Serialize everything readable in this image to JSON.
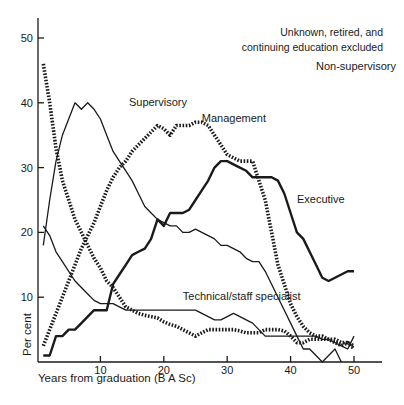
{
  "chart_data": {
    "type": "line",
    "title": "",
    "annotation": [
      "Unknown, retired, and",
      "continuing education excluded"
    ],
    "xlabel": "Years from graduation (B A Sc)",
    "ylabel": "Per cent",
    "xlim": [
      0,
      54
    ],
    "ylim": [
      0,
      53
    ],
    "xticks": [
      10,
      20,
      30,
      40,
      50
    ],
    "yticks": [
      10,
      20,
      30,
      40,
      50
    ],
    "grid": false,
    "legend": "inline labels",
    "series": [
      {
        "name": "Non-supervisory",
        "style": "dotted-thick",
        "label_pos": [
          44,
          45
        ],
        "x": [
          1,
          2,
          3,
          4,
          5,
          6,
          7,
          8,
          9,
          10,
          11,
          12,
          13,
          14,
          15,
          16,
          17,
          18,
          19,
          20,
          21,
          22,
          23,
          24,
          25,
          26,
          27,
          28,
          29,
          30,
          31,
          32,
          33,
          34,
          35,
          36,
          37,
          38,
          39,
          40,
          41,
          42,
          43,
          44,
          45,
          46,
          47,
          48,
          49,
          50
        ],
        "values": [
          46,
          40,
          33,
          28,
          25,
          22,
          20,
          18,
          16,
          14.5,
          12.5,
          11.5,
          10,
          8.5,
          8,
          7.5,
          7.2,
          7,
          6.8,
          6.2,
          5.8,
          5.5,
          5,
          4.5,
          4,
          4.5,
          5,
          5,
          5,
          5,
          5,
          4.8,
          4.5,
          4.5,
          4.5,
          5,
          5,
          5,
          4.8,
          4,
          3,
          3,
          3.5,
          3.5,
          3.5,
          3.5,
          3,
          2.5,
          3,
          2
        ]
      },
      {
        "name": "Supervisory",
        "style": "solid-thin",
        "label_pos": [
          14.5,
          39.5
        ],
        "x": [
          1,
          2,
          3,
          4,
          5,
          6,
          7,
          8,
          9,
          10,
          11,
          12,
          13,
          14,
          15,
          16,
          17,
          18,
          19,
          20,
          21,
          22,
          23,
          24,
          25,
          26,
          27,
          28,
          29,
          30,
          31,
          32,
          33,
          34,
          35,
          36,
          37,
          38,
          39,
          40,
          41,
          42,
          43,
          44,
          45,
          46,
          47,
          48
        ],
        "values": [
          18,
          25,
          31,
          35,
          37.5,
          40,
          39,
          40,
          39,
          37.5,
          35,
          32.5,
          31,
          29.5,
          28,
          26,
          24,
          23,
          22,
          21.5,
          21,
          21,
          20,
          20,
          20.5,
          20,
          19.5,
          19,
          18,
          18,
          17.5,
          17,
          16,
          15.5,
          15.5,
          14,
          12,
          10,
          8,
          6,
          4,
          2,
          2,
          1,
          0,
          1,
          2,
          0
        ]
      },
      {
        "name": "Management",
        "style": "dotted-thick",
        "label_pos": [
          26,
          37
        ],
        "x": [
          1,
          2,
          3,
          4,
          5,
          6,
          7,
          8,
          9,
          10,
          11,
          12,
          13,
          14,
          15,
          16,
          17,
          18,
          19,
          20,
          21,
          22,
          23,
          24,
          25,
          26,
          27,
          28,
          29,
          30,
          31,
          32,
          33,
          34,
          35,
          36,
          37,
          38,
          39,
          40,
          41,
          42,
          43,
          44,
          45,
          46,
          47,
          48,
          49,
          50
        ],
        "values": [
          2.5,
          5,
          7.5,
          10,
          12.5,
          15,
          17.5,
          19.5,
          21.5,
          24,
          26.5,
          28.5,
          30,
          31,
          32.5,
          33.5,
          34.5,
          35.5,
          36.5,
          36,
          35,
          36.5,
          36.5,
          36.5,
          37,
          37,
          36.5,
          35,
          33.5,
          32,
          31.5,
          31,
          31,
          31,
          28,
          25,
          20,
          15,
          12,
          9,
          7,
          5.5,
          4.5,
          4,
          4,
          3.5,
          3.5,
          3,
          3,
          2.5
        ]
      },
      {
        "name": "Executive",
        "style": "solid-thick",
        "label_pos": [
          41,
          24.5
        ],
        "x": [
          1,
          2,
          3,
          4,
          5,
          6,
          7,
          8,
          9,
          10,
          11,
          12,
          13,
          14,
          15,
          16,
          17,
          18,
          19,
          20,
          21,
          22,
          23,
          24,
          25,
          26,
          27,
          28,
          29,
          30,
          31,
          32,
          33,
          34,
          35,
          36,
          37,
          38,
          39,
          40,
          41,
          42,
          43,
          44,
          45,
          46,
          47,
          48,
          49,
          50
        ],
        "values": [
          1,
          1,
          4,
          4,
          5,
          5,
          6,
          7,
          8,
          8,
          8,
          12,
          13.5,
          15,
          16.5,
          17,
          17.5,
          19,
          22,
          21,
          23,
          23,
          23,
          23.5,
          25,
          26.5,
          28,
          30,
          31,
          31,
          30.5,
          30,
          29.5,
          28.5,
          28.5,
          28.5,
          28.5,
          28,
          26,
          23,
          20,
          19,
          17,
          15,
          13,
          12.5,
          13,
          13.5,
          14,
          14
        ]
      },
      {
        "name": "Technical/staff specialist",
        "style": "solid-thin",
        "label_pos": [
          23,
          9.5
        ],
        "x": [
          1,
          2,
          3,
          4,
          5,
          6,
          7,
          8,
          9,
          10,
          11,
          12,
          13,
          14,
          15,
          16,
          17,
          18,
          19,
          20,
          21,
          22,
          23,
          24,
          25,
          26,
          27,
          28,
          29,
          30,
          31,
          32,
          33,
          34,
          35,
          36,
          37,
          38,
          39,
          40,
          41,
          42,
          43,
          44,
          45,
          46,
          47,
          48,
          49,
          50
        ],
        "values": [
          21,
          19.5,
          17,
          15.5,
          14,
          12.5,
          11.5,
          10.5,
          9.5,
          9,
          9,
          9,
          8.5,
          8,
          8,
          8,
          8,
          8,
          8,
          8,
          8,
          8,
          8,
          8,
          8,
          7.5,
          7,
          6.5,
          6.5,
          7,
          7.5,
          7,
          6.5,
          6,
          5,
          4,
          4,
          4,
          4,
          4,
          4,
          4,
          4,
          4,
          3.5,
          3.5,
          3,
          2.5,
          2,
          4
        ]
      }
    ]
  }
}
